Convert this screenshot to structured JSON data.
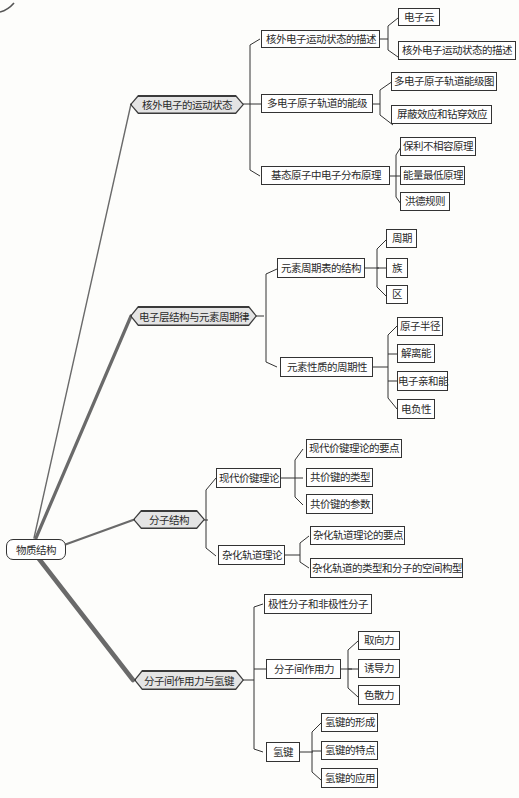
{
  "root": {
    "label": "物质结构"
  },
  "branches": [
    {
      "label": "核外电子的运动状态",
      "children": [
        {
          "label": "核外电子运动状态的描述",
          "children": [
            {
              "label": "电子云"
            },
            {
              "label": "核外电子运动状态的描述"
            }
          ]
        },
        {
          "label": "多电子原子轨道的能级",
          "children": [
            {
              "label": "多电子原子轨道能级图"
            },
            {
              "label": "屏蔽效应和钻穿效应"
            }
          ]
        },
        {
          "label": "基态原子中电子分布原理",
          "children": [
            {
              "label": "保利不相容原理"
            },
            {
              "label": "能量最低原理"
            },
            {
              "label": "洪德规则"
            }
          ]
        }
      ]
    },
    {
      "label": "电子层结构与元素周期律",
      "children": [
        {
          "label": "元素周期表的结构",
          "children": [
            {
              "label": "周期"
            },
            {
              "label": "族"
            },
            {
              "label": "区"
            }
          ]
        },
        {
          "label": "元素性质的周期性",
          "children": [
            {
              "label": "原子半径"
            },
            {
              "label": "解离能"
            },
            {
              "label": "电子亲和能"
            },
            {
              "label": "电负性"
            }
          ]
        }
      ]
    },
    {
      "label": "分子结构",
      "children": [
        {
          "label": "现代价键理论",
          "children": [
            {
              "label": "现代价键理论的要点"
            },
            {
              "label": "共价键的类型"
            },
            {
              "label": "共价键的参数"
            }
          ]
        },
        {
          "label": "杂化轨道理论",
          "children": [
            {
              "label": "杂化轨道理论的要点"
            },
            {
              "label": "杂化轨道的类型和分子的空间构型"
            }
          ]
        }
      ]
    },
    {
      "label": "分子间作用力与氢键",
      "children": [
        {
          "label": "极性分子和非极性分子"
        },
        {
          "label": "分子间作用力",
          "children": [
            {
              "label": "取向力"
            },
            {
              "label": "诱导力"
            },
            {
              "label": "色散力"
            }
          ]
        },
        {
          "label": "氢键",
          "children": [
            {
              "label": "氢键的形成"
            },
            {
              "label": "氢键的特点"
            },
            {
              "label": "氢键的应用"
            }
          ]
        }
      ]
    }
  ],
  "colors": {
    "line": "#333333",
    "trunk": "#6a6a6a",
    "hex_fill": "#e4e4e4",
    "box_border": "#333333",
    "background": "#fdfdfb"
  }
}
